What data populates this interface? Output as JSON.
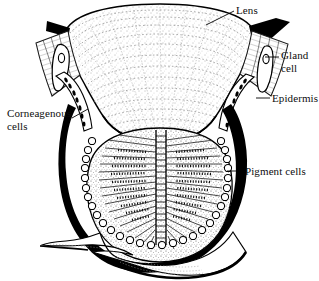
{
  "figure": {
    "style": "black-and-white stippled line drawing",
    "background_color": "#ffffff",
    "ink_color": "#000000",
    "width": 319,
    "height": 281
  },
  "labels": {
    "lens": "Lens",
    "gland_cell": "Gland\ncell",
    "epidermis": "Epidermis",
    "corneagenous_cells": "Corneagenous\ncells",
    "pigment_cells": "Pigment cells"
  },
  "structures": [
    {
      "name": "lens",
      "label": "Lens",
      "description": "Large biconvex stippled dome occupying the upper half of the eye, drawn with concentric dotted growth lines"
    },
    {
      "name": "cuticle-wedge-left",
      "label": "",
      "description": "Thick solid-black cuticular wedge at the upper left rim of the lens"
    },
    {
      "name": "cuticle-wedge-right",
      "label": "",
      "description": "Thick solid-black cuticular wedge at the upper right rim of the lens"
    },
    {
      "name": "gland-cell-left",
      "label": "Gland cell",
      "description": "Flask-shaped gland cell with a dark nucleus set in the epidermis at the left lens margin"
    },
    {
      "name": "gland-cell-right",
      "label": "Gland cell",
      "description": "Flask-shaped gland cell with a dark nucleus set in the epidermis at the right lens margin"
    },
    {
      "name": "epidermis",
      "label": "Epidermis",
      "description": "Hatched epithelial sheet flanking both sides of the lens, continuous with the body wall"
    },
    {
      "name": "corneagenous-cells",
      "label": "Corneagenous cells",
      "description": "Column of dark lens-secreting cells lying immediately beneath the lens margin on each side"
    },
    {
      "name": "pigment-cells",
      "label": "Pigment cells",
      "description": "Ring of rounded nucleated pigment cells forming the dark cup that encloses the retina"
    },
    {
      "name": "rhabdom",
      "label": "",
      "description": "Central vertical rhabdom band with horizontal striations radiating into the retinula cells on either side"
    },
    {
      "name": "nerve-stalk",
      "label": "",
      "description": "Tapering optic nerve stalk leaving the base of the eye cup"
    }
  ],
  "leaders": [
    {
      "label": "Lens",
      "from": "text",
      "to": "lens-surface"
    },
    {
      "label": "Gland cell",
      "from": "text",
      "to": "gland-cell-right"
    },
    {
      "label": "Epidermis",
      "from": "text",
      "to": "epidermis-right"
    },
    {
      "label": "Corneagenous cells",
      "from": "text",
      "to": "corneagenous-cells-left"
    },
    {
      "label": "Pigment cells",
      "from": "text",
      "to": "pigment-cup-right"
    }
  ]
}
